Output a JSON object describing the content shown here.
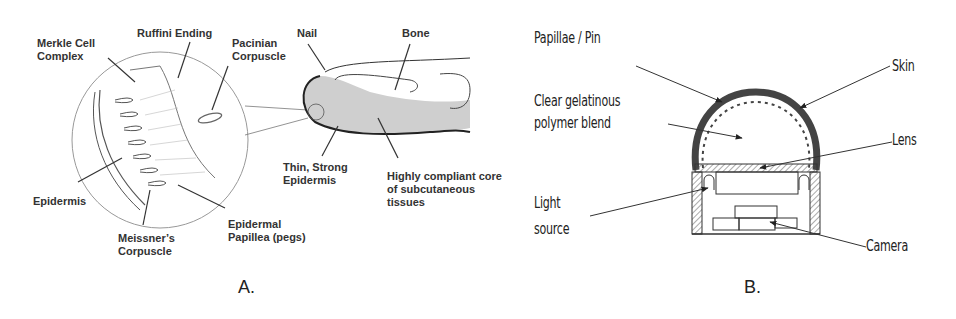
{
  "panel_a": {
    "letter": "A.",
    "labels": {
      "merkle": [
        "Merkle Cell",
        "Complex"
      ],
      "ruffini": "Ruffini Ending",
      "pacinian": [
        "Pacinian",
        "Corpuscle"
      ],
      "nail": "Nail",
      "bone": "Bone",
      "epidermis": "Epidermis",
      "thin_epidermis": [
        "Thin, Strong",
        "Epidermis"
      ],
      "compliant_core": [
        "Highly compliant core",
        "of subcutaneous",
        "tissues"
      ],
      "meissner": [
        "Meissner’s",
        "Corpuscle"
      ],
      "papillea": [
        "Epidermal",
        "Papillea (pegs)"
      ]
    }
  },
  "panel_b": {
    "letter": "B.",
    "labels": {
      "papillae": "Papillae / Pin",
      "gel": [
        "Clear gelatinous",
        "polymer blend"
      ],
      "light": [
        "Light",
        "source"
      ],
      "skin": "Skin",
      "lens": "Lens",
      "camera": "Camera"
    }
  },
  "colors": {
    "line": "#333333",
    "shade": "#cfcfcf",
    "skin_dark": "#444444"
  }
}
